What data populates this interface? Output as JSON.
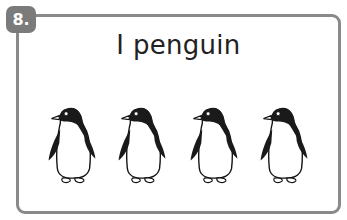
{
  "card": {
    "number": "8.",
    "title": "I penguin",
    "border_color": "#8a8a8a",
    "badge_color": "#7b7b7b"
  },
  "images": {
    "icon": "penguin-icon",
    "count": 4,
    "positions_x": [
      46,
      116,
      188,
      258
    ]
  }
}
